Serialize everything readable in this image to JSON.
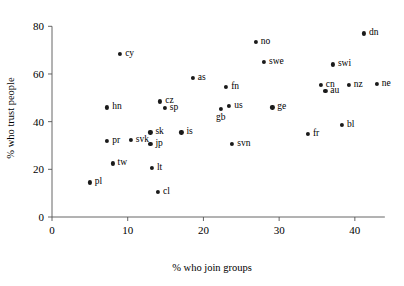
{
  "chart_data": {
    "type": "scatter",
    "title": "",
    "xlabel": "% who join groups",
    "ylabel": "% who trust people",
    "xlim": [
      0,
      45.7
    ],
    "ylim": [
      0,
      86
    ],
    "xticks": [
      0,
      10,
      20,
      30,
      40
    ],
    "yticks": [
      0,
      20,
      40,
      60,
      80
    ],
    "grid": false,
    "legend": "none",
    "marker": "filled-circle",
    "points": [
      {
        "label": "pl",
        "x": 5.0,
        "y": 14.5,
        "label_pos": "right"
      },
      {
        "label": "pr",
        "x": 7.3,
        "y": 32.0,
        "label_pos": "right"
      },
      {
        "label": "hn",
        "x": 7.3,
        "y": 46.0,
        "label_pos": "right"
      },
      {
        "label": "tw",
        "x": 8.0,
        "y": 22.5,
        "label_pos": "right"
      },
      {
        "label": "cy",
        "x": 9.0,
        "y": 68.3,
        "label_pos": "right"
      },
      {
        "label": "svk",
        "x": 10.4,
        "y": 32.5,
        "label_pos": "right"
      },
      {
        "label": "jp",
        "x": 13.0,
        "y": 30.5,
        "label_pos": "right"
      },
      {
        "label": "sk",
        "x": 13.0,
        "y": 35.5,
        "label_pos": "right"
      },
      {
        "label": "lt",
        "x": 13.2,
        "y": 20.5,
        "label_pos": "right"
      },
      {
        "label": "cl",
        "x": 14.0,
        "y": 10.5,
        "label_pos": "right"
      },
      {
        "label": "cz",
        "x": 14.3,
        "y": 48.5,
        "label_pos": "right"
      },
      {
        "label": "sp",
        "x": 14.9,
        "y": 45.8,
        "label_pos": "right"
      },
      {
        "label": "is",
        "x": 17.1,
        "y": 35.5,
        "label_pos": "right"
      },
      {
        "label": "as",
        "x": 18.6,
        "y": 58.5,
        "label_pos": "right"
      },
      {
        "label": "gb",
        "x": 22.3,
        "y": 45.5,
        "label_pos": "below"
      },
      {
        "label": "fn",
        "x": 23.0,
        "y": 54.5,
        "label_pos": "right"
      },
      {
        "label": "us",
        "x": 23.4,
        "y": 46.5,
        "label_pos": "right"
      },
      {
        "label": "svn",
        "x": 23.8,
        "y": 30.5,
        "label_pos": "right"
      },
      {
        "label": "no",
        "x": 26.9,
        "y": 73.5,
        "label_pos": "right"
      },
      {
        "label": "swe",
        "x": 28.0,
        "y": 65.0,
        "label_pos": "right"
      },
      {
        "label": "ge",
        "x": 29.1,
        "y": 46.0,
        "label_pos": "right"
      },
      {
        "label": "fr",
        "x": 33.8,
        "y": 35.0,
        "label_pos": "right"
      },
      {
        "label": "cn",
        "x": 35.5,
        "y": 55.5,
        "label_pos": "right"
      },
      {
        "label": "au",
        "x": 36.1,
        "y": 53.0,
        "label_pos": "right"
      },
      {
        "label": "swi",
        "x": 37.1,
        "y": 64.0,
        "label_pos": "right"
      },
      {
        "label": "bl",
        "x": 38.3,
        "y": 38.5,
        "label_pos": "right"
      },
      {
        "label": "nz",
        "x": 39.2,
        "y": 55.5,
        "label_pos": "right"
      },
      {
        "label": "dn",
        "x": 41.2,
        "y": 77.0,
        "label_pos": "right"
      },
      {
        "label": "ne",
        "x": 42.9,
        "y": 55.8,
        "label_pos": "right"
      }
    ]
  }
}
